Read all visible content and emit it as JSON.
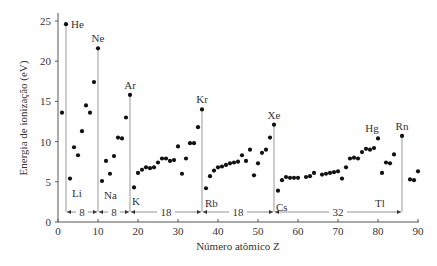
{
  "chart_data": {
    "type": "scatter",
    "title": "",
    "xlabel": "Número atômico Z",
    "ylabel": "Energia de ionização (eV)",
    "xlim": [
      0,
      90
    ],
    "ylim": [
      0,
      26
    ],
    "xticks": [
      0,
      10,
      20,
      30,
      40,
      50,
      60,
      70,
      80,
      90
    ],
    "yticks": [
      0,
      5,
      10,
      15,
      20,
      25
    ],
    "grid": false,
    "points": [
      [
        1,
        13.6
      ],
      [
        2,
        24.6
      ],
      [
        3,
        5.4
      ],
      [
        4,
        9.3
      ],
      [
        5,
        8.3
      ],
      [
        6,
        11.3
      ],
      [
        7,
        14.5
      ],
      [
        8,
        13.6
      ],
      [
        9,
        17.4
      ],
      [
        10,
        21.6
      ],
      [
        11,
        5.1
      ],
      [
        12,
        7.6
      ],
      [
        13,
        6.0
      ],
      [
        14,
        8.2
      ],
      [
        15,
        10.5
      ],
      [
        16,
        10.4
      ],
      [
        17,
        13.0
      ],
      [
        18,
        15.8
      ],
      [
        19,
        4.3
      ],
      [
        20,
        6.1
      ],
      [
        21,
        6.5
      ],
      [
        22,
        6.8
      ],
      [
        23,
        6.7
      ],
      [
        24,
        6.8
      ],
      [
        25,
        7.4
      ],
      [
        26,
        7.9
      ],
      [
        27,
        7.9
      ],
      [
        28,
        7.6
      ],
      [
        29,
        7.7
      ],
      [
        30,
        9.4
      ],
      [
        31,
        6.0
      ],
      [
        32,
        7.9
      ],
      [
        33,
        9.8
      ],
      [
        34,
        9.8
      ],
      [
        35,
        11.8
      ],
      [
        36,
        14.0
      ],
      [
        37,
        4.2
      ],
      [
        38,
        5.7
      ],
      [
        39,
        6.4
      ],
      [
        40,
        6.8
      ],
      [
        41,
        6.9
      ],
      [
        42,
        7.1
      ],
      [
        43,
        7.3
      ],
      [
        44,
        7.4
      ],
      [
        45,
        7.5
      ],
      [
        46,
        8.3
      ],
      [
        47,
        7.6
      ],
      [
        48,
        9.0
      ],
      [
        49,
        5.8
      ],
      [
        50,
        7.3
      ],
      [
        51,
        8.6
      ],
      [
        52,
        9.0
      ],
      [
        53,
        10.5
      ],
      [
        54,
        12.1
      ],
      [
        55,
        3.9
      ],
      [
        56,
        5.2
      ],
      [
        57,
        5.6
      ],
      [
        58,
        5.5
      ],
      [
        59,
        5.5
      ],
      [
        60,
        5.5
      ],
      [
        62,
        5.6
      ],
      [
        63,
        5.7
      ],
      [
        64,
        6.1
      ],
      [
        66,
        5.9
      ],
      [
        67,
        6.0
      ],
      [
        68,
        6.1
      ],
      [
        69,
        6.2
      ],
      [
        70,
        6.3
      ],
      [
        71,
        5.4
      ],
      [
        72,
        6.8
      ],
      [
        73,
        7.9
      ],
      [
        74,
        8.0
      ],
      [
        75,
        7.9
      ],
      [
        76,
        8.7
      ],
      [
        77,
        9.1
      ],
      [
        78,
        9.0
      ],
      [
        79,
        9.2
      ],
      [
        80,
        10.4
      ],
      [
        81,
        6.1
      ],
      [
        82,
        7.4
      ],
      [
        83,
        7.3
      ],
      [
        84,
        8.4
      ],
      [
        86,
        10.7
      ],
      [
        88,
        5.3
      ],
      [
        89,
        5.2
      ],
      [
        90,
        6.3
      ]
    ],
    "noble_gas_lines": [
      {
        "z": 2,
        "value": 24.6,
        "label": "He"
      },
      {
        "z": 10,
        "value": 21.6,
        "label": "Ne"
      },
      {
        "z": 18,
        "value": 15.8,
        "label": "Ar"
      },
      {
        "z": 36,
        "value": 14.0,
        "label": "Kr"
      },
      {
        "z": 54,
        "value": 12.1,
        "label": "Xe"
      },
      {
        "z": 86,
        "value": 10.7,
        "label": "Rn"
      }
    ],
    "annotations": [
      {
        "text": "He",
        "z": 2,
        "value": 24.6
      },
      {
        "text": "Ne",
        "z": 10,
        "value": 21.6
      },
      {
        "text": "Ar",
        "z": 18,
        "value": 15.8
      },
      {
        "text": "Kr",
        "z": 36,
        "value": 14.0
      },
      {
        "text": "Xe",
        "z": 54,
        "value": 12.1
      },
      {
        "text": "Hg",
        "z": 80,
        "value": 10.4
      },
      {
        "text": "Rn",
        "z": 86,
        "value": 10.7
      },
      {
        "text": "Tl",
        "z": 81,
        "value": 6.1
      },
      {
        "text": "Li",
        "z": 3,
        "value": 5.4
      },
      {
        "text": "Na",
        "z": 11,
        "value": 5.1
      },
      {
        "text": "K",
        "z": 19,
        "value": 4.3
      },
      {
        "text": "Rb",
        "z": 37,
        "value": 4.2
      },
      {
        "text": "Cs",
        "z": 55,
        "value": 3.9
      }
    ],
    "period_spans": [
      {
        "from": 2,
        "to": 10,
        "label": "8"
      },
      {
        "from": 10,
        "to": 18,
        "label": "8"
      },
      {
        "from": 18,
        "to": 36,
        "label": "18"
      },
      {
        "from": 36,
        "to": 54,
        "label": "18"
      },
      {
        "from": 54,
        "to": 86,
        "label": "32"
      }
    ]
  }
}
